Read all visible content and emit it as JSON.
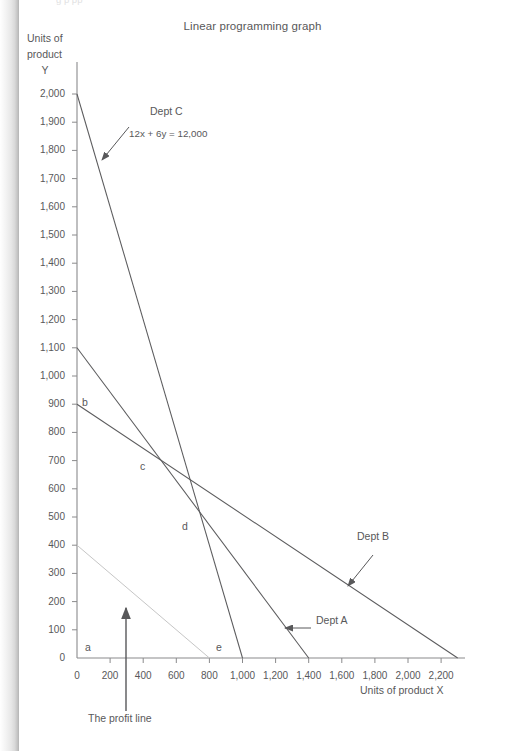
{
  "page": {
    "cropped_header_fragment": "g  p                                                                                                                pp",
    "title": "Linear programming graph"
  },
  "axes": {
    "y_title_line1": "Units of",
    "y_title_line2": "product",
    "y_title_line3": "Y",
    "x_title": "Units of product X",
    "y_ticks": [
      "2,000",
      "1,900",
      "1,800",
      "1,700",
      "1,600",
      "1,500",
      "1,400",
      "1,300",
      "1,200",
      "1,100",
      "1,000",
      "900",
      "800",
      "700",
      "600",
      "500",
      "400",
      "300",
      "200",
      "100",
      "0"
    ],
    "y_tick_values": [
      2000,
      1900,
      1800,
      1700,
      1600,
      1500,
      1400,
      1300,
      1200,
      1100,
      1000,
      900,
      800,
      700,
      600,
      500,
      400,
      300,
      200,
      100,
      0
    ],
    "x_ticks": [
      "0",
      "200",
      "400",
      "600",
      "800",
      "1,000",
      "1,200",
      "1,400",
      "1,600",
      "1,800",
      "2,000",
      "2,200"
    ],
    "x_tick_values": [
      0,
      200,
      400,
      600,
      800,
      1000,
      1200,
      1400,
      1600,
      1800,
      2000,
      2200
    ]
  },
  "annotations": {
    "dept_c": "Dept C",
    "dept_c_equation": "12x + 6y = 12,000",
    "dept_b": "Dept B",
    "dept_a": "Dept A",
    "profit_line": "The profit line"
  },
  "vertices": {
    "a": "a",
    "b": "b",
    "c": "c",
    "d": "d",
    "e": "e"
  },
  "colors": {
    "line": "#5b5b5d",
    "profit_line": "#c6c6c6",
    "axis": "#8a8a8c",
    "text": "#58585a",
    "page_background": "#ffffff"
  },
  "chart_data": {
    "type": "line",
    "title": "Linear programming graph",
    "xlabel": "Units of product X",
    "ylabel": "Units of product Y",
    "xlim": [
      0,
      2400
    ],
    "ylim": [
      0,
      2100
    ],
    "grid": false,
    "legend": "inline-annotations",
    "series": [
      {
        "name": "Dept C",
        "equation": "12x + 6y = 12,000",
        "x": [
          0,
          1000
        ],
        "y": [
          2000,
          0
        ],
        "color": "#5b5b5d",
        "x_intercept": 1000,
        "y_intercept": 2000
      },
      {
        "name": "Dept A",
        "x": [
          0,
          1400
        ],
        "y": [
          1100,
          0
        ],
        "color": "#5b5b5d",
        "x_intercept": 1400,
        "y_intercept": 1100
      },
      {
        "name": "Dept B",
        "x": [
          0,
          2300
        ],
        "y": [
          900,
          0
        ],
        "color": "#5b5b5d",
        "x_intercept": 2300,
        "y_intercept": 900
      },
      {
        "name": "The profit line",
        "x": [
          0,
          800
        ],
        "y": [
          400,
          0
        ],
        "color": "#c6c6c6",
        "x_intercept": 800,
        "y_intercept": 400
      }
    ],
    "feasible_region_vertices": [
      {
        "label": "a",
        "x": 0,
        "y": 0
      },
      {
        "label": "b",
        "x": 0,
        "y": 900
      },
      {
        "label": "c",
        "x": 650,
        "y": 680
      },
      {
        "label": "d",
        "x": 890,
        "y": 490
      },
      {
        "label": "e",
        "x": 1000,
        "y": 0
      }
    ]
  }
}
